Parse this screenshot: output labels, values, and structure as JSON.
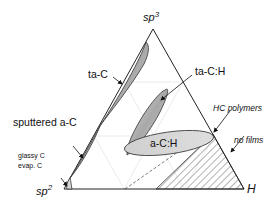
{
  "diagram": {
    "type": "ternary-phase-diagram",
    "vertices": {
      "top": {
        "base": "sp",
        "sup": "3"
      },
      "bottom_left": {
        "base": "sp",
        "sup": "2"
      },
      "bottom_right": "H"
    },
    "regions": [
      {
        "name": "ta-C",
        "label": "ta-C"
      },
      {
        "name": "ta-C:H",
        "label": "ta-C:H"
      },
      {
        "name": "sputtered a-C",
        "label": "sputtered a-C"
      },
      {
        "name": "a-C:H",
        "label": "a-C:H"
      },
      {
        "name": "glassy-evap",
        "label_line1": "glassy C",
        "label_line2": "evap. C"
      },
      {
        "name": "HC polymers",
        "label": "HC polymers"
      },
      {
        "name": "no films",
        "label": "no films"
      }
    ],
    "colors": {
      "region_fill": "#b8b8b8",
      "region_fill_light": "#d6d6d6",
      "outline": "#333333",
      "grid": "#e6e6e6",
      "hatch": "#555555"
    }
  }
}
